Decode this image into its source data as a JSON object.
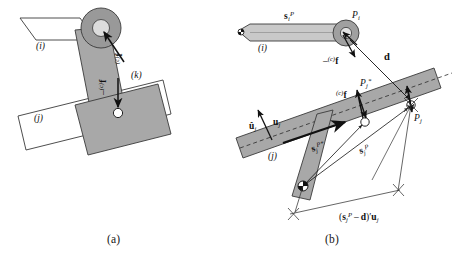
{
  "figure": {
    "caption_a": "(a)",
    "caption_b": "(b)",
    "background_color": "#ffffff",
    "body_fill": "#a8a8a8",
    "hub_fill": "#999999",
    "hub_inner_fill": "#d8d8d8",
    "outline_color": "#3a3a3a",
    "line_color": "#1a1a1a"
  },
  "panel_a": {
    "label_link_i": "(i)",
    "label_link_j": "(j)",
    "label_link_k": "(k)",
    "force_upper": {
      "presup": "(c)",
      "symbol": "f",
      "sign": ""
    },
    "force_lower": {
      "presup": "(c)",
      "symbol": "f",
      "sign": "–"
    }
  },
  "panel_b": {
    "label_link_i": "(i)",
    "label_link_j": "(j)",
    "vector_s_i_P": {
      "bold": "s",
      "sub": "i",
      "sup": "P"
    },
    "vector_s_j_P": {
      "bold": "s",
      "sub": "j",
      "sup": "P"
    },
    "vector_s_j_Pstar": {
      "bold": "s",
      "sub": "j",
      "sup": "P*"
    },
    "vector_d": {
      "bold": "d"
    },
    "vector_u_hat_j": {
      "bold": "û",
      "sub": "j"
    },
    "vector_u_j": {
      "bold": "u",
      "sub": "j"
    },
    "point_Pi": {
      "symbol": "P",
      "sub": "i"
    },
    "point_Pj": {
      "symbol": "P",
      "sub": "j"
    },
    "point_Pj_star": {
      "symbol": "P",
      "sub": "j",
      "sup": "*"
    },
    "force_at_Pi": {
      "sign": "–",
      "presup": "(c)",
      "symbol": "f"
    },
    "force_at_Pj": {
      "sign": "",
      "presup": "(c)",
      "symbol": "f"
    },
    "projection_expression": "(sᵢᵖ – d)′uⱼ",
    "projection_parts": {
      "open": "(",
      "s_bold": "s",
      "s_sub": "j",
      "s_sup": "P",
      "minus": "–",
      "d_bold": "d",
      "close": ")",
      "prime": "′",
      "u_bold": "u",
      "u_sub": "j"
    }
  }
}
